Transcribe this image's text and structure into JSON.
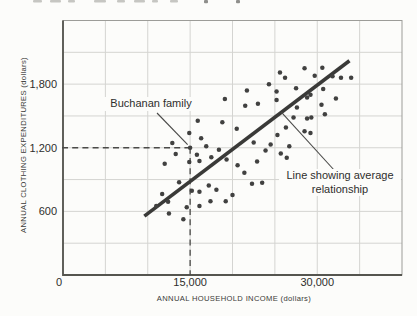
{
  "figure_background": "#fcfcfa",
  "chart_data": {
    "type": "scatter",
    "title": "",
    "xlabel": "ANNUAL HOUSEHOLD INCOME (dollars)",
    "ylabel": "ANNUAL CLOTHING EXPENDITURES (dollars)",
    "xlim": [
      0,
      40000
    ],
    "ylim": [
      0,
      2400
    ],
    "grid": true,
    "x_gridline_step": 5000,
    "y_gridline_step": 300,
    "x_ticks": [
      {
        "value": 0,
        "label": "0"
      },
      {
        "value": 15000,
        "label": "15,000"
      },
      {
        "value": 30000,
        "label": "30,000"
      }
    ],
    "y_ticks": [
      {
        "value": 600,
        "label": "600"
      },
      {
        "value": 1200,
        "label": "1,200"
      },
      {
        "value": 1800,
        "label": "1,800"
      }
    ],
    "points": [
      [
        28500,
        1950
      ],
      [
        30600,
        1955
      ],
      [
        29700,
        1880
      ],
      [
        31800,
        1875
      ],
      [
        32800,
        1860
      ],
      [
        34000,
        1860
      ],
      [
        25600,
        1910
      ],
      [
        24300,
        1800
      ],
      [
        26200,
        1860
      ],
      [
        19100,
        1660
      ],
      [
        21700,
        1740
      ],
      [
        25200,
        1730
      ],
      [
        25200,
        1650
      ],
      [
        27500,
        1760
      ],
      [
        30700,
        1755
      ],
      [
        29200,
        1700
      ],
      [
        28800,
        1675
      ],
      [
        32200,
        1665
      ],
      [
        23000,
        1615
      ],
      [
        21500,
        1595
      ],
      [
        27600,
        1580
      ],
      [
        30500,
        1605
      ],
      [
        30900,
        1515
      ],
      [
        29300,
        1485
      ],
      [
        27200,
        1485
      ],
      [
        28800,
        1475
      ],
      [
        18800,
        1440
      ],
      [
        15900,
        1455
      ],
      [
        20500,
        1380
      ],
      [
        26300,
        1390
      ],
      [
        28500,
        1355
      ],
      [
        29200,
        1340
      ],
      [
        14900,
        1340
      ],
      [
        16300,
        1290
      ],
      [
        25300,
        1320
      ],
      [
        12900,
        1245
      ],
      [
        15000,
        1200
      ],
      [
        16900,
        1215
      ],
      [
        18400,
        1180
      ],
      [
        22500,
        1250
      ],
      [
        23900,
        1175
      ],
      [
        24500,
        1230
      ],
      [
        26700,
        1215
      ],
      [
        25700,
        1145
      ],
      [
        26400,
        1105
      ],
      [
        13300,
        1140
      ],
      [
        15800,
        1135
      ],
      [
        17500,
        1110
      ],
      [
        12000,
        1050
      ],
      [
        14900,
        1065
      ],
      [
        16100,
        1075
      ],
      [
        19300,
        1090
      ],
      [
        20600,
        1035
      ],
      [
        21400,
        965
      ],
      [
        22900,
        1070
      ],
      [
        13700,
        875
      ],
      [
        17200,
        845
      ],
      [
        22300,
        860
      ],
      [
        23500,
        870
      ],
      [
        15200,
        795
      ],
      [
        16100,
        785
      ],
      [
        18100,
        805
      ],
      [
        11700,
        765
      ],
      [
        20000,
        755
      ],
      [
        19200,
        695
      ],
      [
        17400,
        695
      ],
      [
        12400,
        690
      ],
      [
        14600,
        640
      ],
      [
        16100,
        650
      ],
      [
        11000,
        650
      ],
      [
        12500,
        580
      ],
      [
        14200,
        525
      ]
    ],
    "highlight_point": {
      "income": 15000,
      "expenditure": 1200
    },
    "trend_line": {
      "from": [
        9600,
        555
      ],
      "to": [
        33800,
        2020
      ]
    },
    "annotations": {
      "point_label": "Buchanan family",
      "trend_label": [
        "Line showing average",
        "relationship"
      ]
    },
    "legend": "none",
    "colors": {
      "dot": "#414140",
      "trend": "#3a3a38",
      "grid": "#d4d4d1",
      "frame": "#9c9c98",
      "axis": "#55554f",
      "dashed": "#4a4a48",
      "text": "#2e2e2c",
      "leader": "#4a4a48"
    }
  },
  "artifacts": {
    "top_cropped_text_marks": [
      {
        "x": 33,
        "w": 9
      },
      {
        "x": 50,
        "w": 11
      },
      {
        "x": 68,
        "w": 7
      },
      {
        "x": 94,
        "w": 12
      },
      {
        "x": 117,
        "w": 8
      },
      {
        "x": 134,
        "w": 11
      },
      {
        "x": 152,
        "w": 6
      },
      {
        "x": 170,
        "w": 8
      },
      {
        "x": 204,
        "w": 4,
        "dark": true
      },
      {
        "x": 236,
        "w": 4,
        "dark": true
      }
    ]
  }
}
